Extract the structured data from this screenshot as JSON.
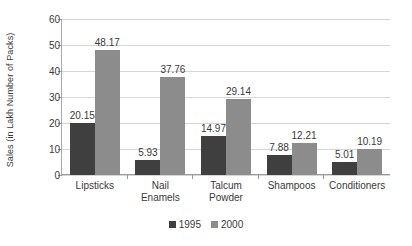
{
  "chart_data": {
    "type": "bar",
    "title": "",
    "subtitle": "",
    "xlabel": "",
    "ylabel": "Sales (in Lakh Number of Packs)",
    "categories": [
      "Lipsticks",
      "Nail Enamels",
      "Talcum Powder",
      "Shampoos",
      "Conditioners"
    ],
    "category_lines": [
      [
        "Lipsticks"
      ],
      [
        "Nail",
        "Enamels"
      ],
      [
        "Talcum",
        "Powder"
      ],
      [
        "Shampoos"
      ],
      [
        "Conditioners"
      ]
    ],
    "series": [
      {
        "name": "1995",
        "color": "#3f3f3f",
        "values": [
          20.15,
          5.93,
          14.97,
          7.88,
          5.01
        ],
        "labels": [
          "20.15",
          "5.93",
          "14.97",
          "7.88",
          "5.01"
        ]
      },
      {
        "name": "2000",
        "color": "#8c8c8c",
        "values": [
          48.17,
          37.76,
          29.14,
          12.21,
          10.19
        ],
        "labels": [
          "48.17",
          "37.76",
          "29.14",
          "12.21",
          "10.19"
        ]
      }
    ],
    "ylim": [
      0,
      60
    ],
    "yticks": [
      0,
      10,
      20,
      30,
      40,
      50,
      60
    ],
    "ytick_labels": [
      "0",
      "10",
      "20",
      "30",
      "40",
      "50",
      "60"
    ],
    "grid": true,
    "grid_axis": "y",
    "legend_position": "bottom",
    "data_labels": true,
    "background_color": "#ffffff",
    "text_color": "#3a3a3a",
    "gridline_color": "#d6d6d6",
    "axis_color": "#9a9a9a"
  }
}
